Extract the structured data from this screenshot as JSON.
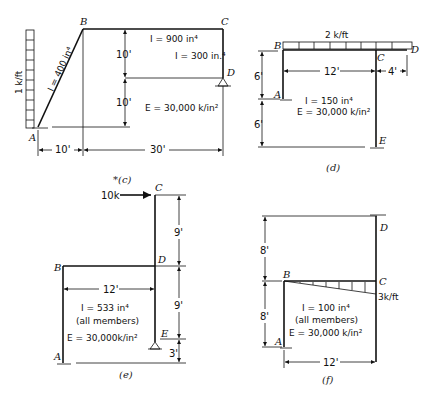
{
  "figures": {
    "c": {
      "caption": "*(c)",
      "nodes": {
        "A": "A",
        "B": "B",
        "C": "C",
        "D": "D"
      },
      "load": "1 k/ft",
      "I_AB": "I = 400 in⁴",
      "I_BC": "I = 900 in⁴",
      "I_CD": "I = 300 in.⁴",
      "E": "E = 30,000 k/in²",
      "dims": {
        "v1": "10'",
        "v2": "10'",
        "h1": "10'",
        "h2": "30'"
      }
    },
    "d": {
      "caption": "(d)",
      "nodes": {
        "A": "A",
        "B": "B",
        "C": "C",
        "D": "D",
        "E": "E"
      },
      "load": "2 k/ft",
      "I": "I = 150 in⁴",
      "E": "E = 30,000 k/in²",
      "dims": {
        "v1": "6'",
        "v2": "6'",
        "h1": "12'",
        "h2": "4'"
      }
    },
    "e": {
      "caption": "(e)",
      "nodes": {
        "A": "A",
        "B": "B",
        "C": "C",
        "D": "D",
        "E": "E"
      },
      "load": "10k",
      "I": "I = 533 in⁴",
      "members": "(all members)",
      "E": "E = 30,000k/in²",
      "dims": {
        "v1": "9'",
        "v2": "9'",
        "v3": "3'",
        "h1": "12'"
      }
    },
    "f": {
      "caption": "(f)",
      "nodes": {
        "A": "A",
        "B": "B",
        "C": "C",
        "D": "D"
      },
      "load": "3k/ft",
      "I": "I = 100 in⁴",
      "members": "(all members)",
      "E": "E = 30,000 k/in²",
      "dims": {
        "v1": "8'",
        "v2": "8'",
        "h1": "12'"
      }
    }
  }
}
